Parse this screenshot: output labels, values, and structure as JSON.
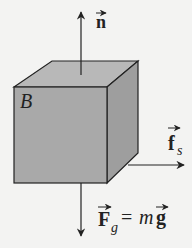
{
  "diagram": {
    "type": "free-body-diagram",
    "object": {
      "label": "B",
      "shape": "cube",
      "fill_front": "#a9a9a9",
      "fill_top": "#b8b8b8",
      "fill_side": "#9e9e9e"
    },
    "forces": [
      {
        "id": "normal",
        "symbol": "n",
        "direction": "up"
      },
      {
        "id": "static-friction",
        "symbol": "f",
        "subscript": "s",
        "direction": "right"
      },
      {
        "id": "gravity",
        "symbol": "F",
        "subscript": "g",
        "equation_rhs_italic": "m",
        "equation_rhs_bold": "g",
        "equals": "=",
        "direction": "down"
      }
    ],
    "colors": {
      "background": "#f3f3f2",
      "stroke": "#222222"
    }
  }
}
